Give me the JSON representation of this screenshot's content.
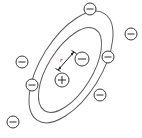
{
  "figure": {
    "background_color": "#ffffff",
    "width": 142,
    "height": 138
  },
  "labels": {
    "radius": "r"
  },
  "symbols": {
    "nucleus_sign": "+",
    "electron_sign": "−"
  },
  "colors": {
    "orbit_stroke": "#5a5a5a",
    "particle_stroke": "#3a3a3a",
    "particle_fill": "#ffffff",
    "dimension_stroke": "#1a1a1a",
    "label_color": "#1a1a1a"
  },
  "orbits": [
    {
      "name": "outer-orbit",
      "cx": 71,
      "cy": 67,
      "rx": 63,
      "ry": 30,
      "rotation_deg": -58
    },
    {
      "name": "inner-orbit",
      "cx": 70,
      "cy": 70,
      "rx": 48,
      "ry": 22,
      "rotation_deg": -58
    }
  ],
  "nucleus": {
    "name": "nucleus",
    "cx": 62,
    "cy": 80,
    "r": 7,
    "charge": "+"
  },
  "electrons": [
    {
      "name": "electron-upper-left-outer",
      "cx": 90,
      "cy": 9,
      "r": 6,
      "orbit": "outer-orbit"
    },
    {
      "name": "electron-right-outer",
      "cx": 131,
      "cy": 34,
      "r": 6,
      "orbit": "outer-orbit"
    },
    {
      "name": "electron-left-outer",
      "cx": 22,
      "cy": 62,
      "r": 6,
      "orbit": "outer-orbit"
    },
    {
      "name": "electron-bottom-outer",
      "cx": 13,
      "cy": 122,
      "r": 6,
      "orbit": "outer-orbit"
    },
    {
      "name": "electron-right-inner",
      "cx": 108,
      "cy": 57,
      "r": 6,
      "orbit": "inner-orbit"
    },
    {
      "name": "electron-left-inner",
      "cx": 32,
      "cy": 85,
      "r": 6,
      "orbit": "inner-orbit"
    },
    {
      "name": "electron-lower-right-inner",
      "cx": 100,
      "cy": 95,
      "r": 6,
      "orbit": "inner-orbit"
    },
    {
      "name": "electron-radius-target",
      "cx": 82,
      "cy": 59,
      "r": 7,
      "orbit": "inner-orbit"
    }
  ],
  "radius_dimension": {
    "name": "radius-dimension",
    "from_x": 58,
    "from_y": 70,
    "to_x": 74,
    "to_y": 52,
    "label": "r",
    "label_x": 60,
    "label_y": 61
  }
}
